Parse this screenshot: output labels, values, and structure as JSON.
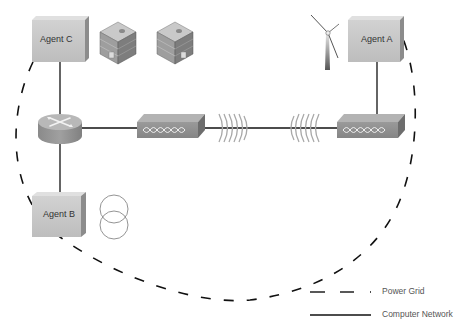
{
  "diagram": {
    "agents": [
      {
        "id": "agent-c",
        "label": "Agent C"
      },
      {
        "id": "agent-a",
        "label": "Agent A"
      },
      {
        "id": "agent-b",
        "label": "Agent B"
      }
    ],
    "icons": [
      {
        "name": "building-icon",
        "count": 2,
        "attached_to": "Agent C"
      },
      {
        "name": "wind-turbine-icon",
        "attached_to": "Agent A"
      },
      {
        "name": "transformer-icon",
        "attached_to": "Agent B"
      },
      {
        "name": "router-icon"
      },
      {
        "name": "wireless-bridge-icon",
        "count": 2
      },
      {
        "name": "radio-wave-icon",
        "count": 2
      }
    ],
    "legend": {
      "power_grid": "Power Grid",
      "computer_network": "Computer Network"
    }
  }
}
